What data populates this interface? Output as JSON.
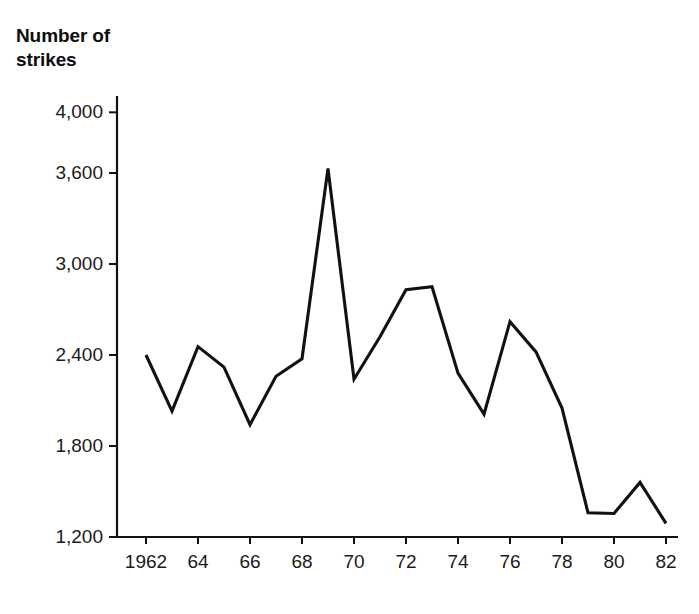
{
  "chart_data": {
    "type": "line",
    "title": "",
    "ylabel": "Number of\nstrikes",
    "xlabel": "",
    "x": [
      1962,
      1963,
      1964,
      1965,
      1966,
      1967,
      1968,
      1969,
      1970,
      1971,
      1972,
      1973,
      1974,
      1975,
      1976,
      1977,
      1978,
      1979,
      1980,
      1981,
      1982
    ],
    "values": [
      2400,
      2030,
      2455,
      2320,
      1940,
      2260,
      2375,
      3630,
      2240,
      2520,
      2830,
      2850,
      2280,
      2010,
      2620,
      2420,
      2050,
      1360,
      1355,
      1560,
      1290
    ],
    "series": [
      {
        "name": "Number of strikes",
        "values": [
          2400,
          2030,
          2455,
          2320,
          1940,
          2260,
          2375,
          3630,
          2240,
          2520,
          2830,
          2850,
          2280,
          2010,
          2620,
          2420,
          2050,
          1360,
          1355,
          1560,
          1290
        ]
      }
    ],
    "ytick_labels": [
      "4,000",
      "3,600",
      "3,000",
      "2,400",
      "1,800",
      "1,200"
    ],
    "ytick_values": [
      4000,
      3600,
      3000,
      2400,
      1800,
      1200
    ],
    "xtick_labels": [
      "1962",
      "64",
      "66",
      "68",
      "70",
      "72",
      "74",
      "76",
      "78",
      "80",
      "82"
    ],
    "xtick_values": [
      1962,
      1964,
      1966,
      1968,
      1970,
      1972,
      1974,
      1976,
      1978,
      1980,
      1982
    ],
    "xlim": [
      1962,
      1982
    ],
    "ylim": [
      1200,
      4000
    ],
    "grid": false,
    "legend": "none",
    "line_color": "#111111",
    "axis_color": "#111111"
  },
  "axis_title": {
    "line1": "Number of",
    "line2": "strikes"
  }
}
